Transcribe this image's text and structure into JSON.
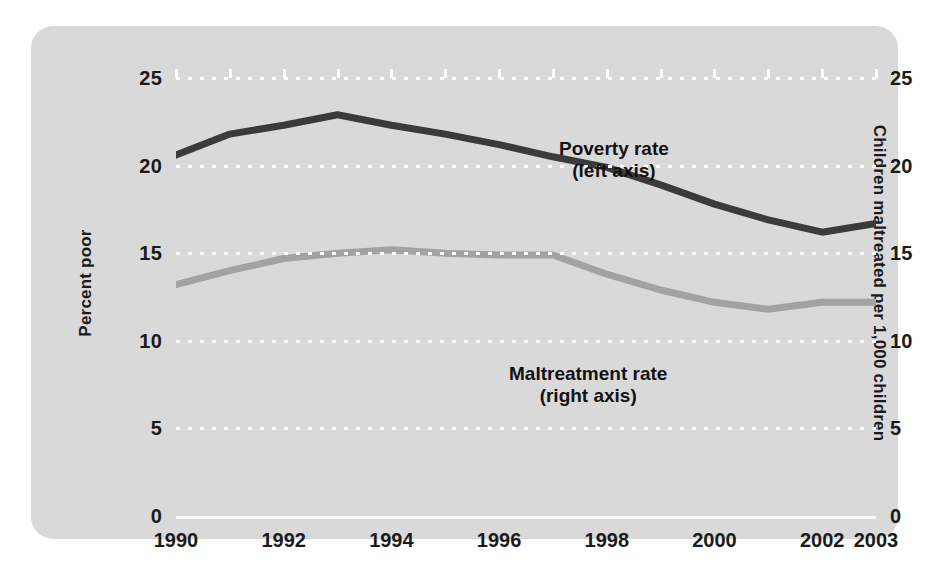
{
  "chart_data": {
    "type": "line",
    "title": "",
    "xlabel": "",
    "ylabel": "Percent poor",
    "ylabel_right": "Children maltreated per 1,000 children",
    "x": [
      1990,
      1991,
      1992,
      1993,
      1994,
      1995,
      1996,
      1997,
      1998,
      1999,
      2000,
      2001,
      2002,
      2003
    ],
    "xtick_labels": [
      "1990",
      "1991",
      "1992",
      "1993",
      "1994",
      "1995",
      "1996",
      "1997",
      "1998",
      "1999",
      "2000",
      "2001",
      "2002",
      "2003"
    ],
    "xtick_labels_shown": [
      "1990",
      "1992",
      "1994",
      "1996",
      "1998",
      "2000",
      "2002",
      "2003"
    ],
    "ytick_labels": [
      "0",
      "5",
      "10",
      "15",
      "20",
      "25"
    ],
    "ytick_values": [
      0,
      5,
      10,
      15,
      20,
      25
    ],
    "ytick_labels_right": [
      "0",
      "5",
      "10",
      "15",
      "20",
      "25"
    ],
    "ylim": [
      0,
      25
    ],
    "ylim_right": [
      0,
      25
    ],
    "xlim": [
      1990,
      2003
    ],
    "grid": true,
    "grid_style": "dotted-white-horizontal",
    "legend": "inline-annotations",
    "series": [
      {
        "name": "Poverty rate",
        "annotation": "Poverty rate",
        "annotation_sub": "(left axis)",
        "axis": "left",
        "color": "#3b3b3b",
        "values": [
          20.6,
          21.8,
          22.3,
          22.9,
          22.3,
          21.8,
          21.2,
          20.5,
          19.9,
          18.9,
          17.8,
          16.9,
          16.2,
          16.7
        ]
      },
      {
        "name": "Maltreatment rate",
        "annotation": "Maltreatment rate",
        "annotation_sub": "(right axis)",
        "axis": "right",
        "color": "#a2a2a2",
        "values": [
          13.2,
          14.0,
          14.7,
          15.0,
          15.2,
          15.0,
          14.9,
          14.9,
          13.8,
          12.9,
          12.2,
          11.8,
          12.2,
          12.2
        ]
      }
    ]
  },
  "panel": {
    "background": "#d9d9d9",
    "page_background": "#ffffff"
  },
  "axis": {
    "left_title": "Percent poor",
    "right_title": "Children maltreated per 1,000 children",
    "axis_color": "#ffffff",
    "tick_label_color": "#1a1a1a"
  },
  "annotations": {
    "poverty_line1": "Poverty rate",
    "poverty_line2": "(left axis)",
    "maltreat_line1": "Maltreatment rate",
    "maltreat_line2": "(right axis)"
  }
}
